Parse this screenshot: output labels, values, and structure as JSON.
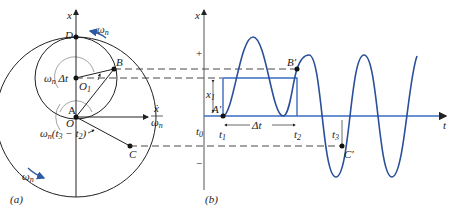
{
  "figure": {
    "panel_a": {
      "caption": "(a)",
      "axis_label": "x",
      "points": {
        "D": "D",
        "B": "B",
        "O1": "O",
        "O1_sub": "1",
        "A": "A",
        "O": "O",
        "C": "C"
      },
      "omega_top": "ω",
      "omega_top_sub": "n",
      "omega_bottom": "ω",
      "omega_bottom_sub": "n",
      "angle_dt": "ω",
      "angle_dt_sub": "n",
      "angle_dt_rest": " Δt",
      "angle_t3": "ω",
      "angle_t3_sub": "n",
      "angle_t3_rest": "(t",
      "angle_t3_sub3": "3",
      "angle_t3_mid": " − t",
      "angle_t3_sub2": "2",
      "angle_t3_end": ")",
      "horiz_axis_num": "ẋ",
      "horiz_axis_den": "ω",
      "horiz_axis_den_sub": "n",
      "colors": {
        "arrow": "#2b5aa0",
        "line": "#222222"
      }
    },
    "panel_b": {
      "caption": "(b)",
      "y_axis_label": "x",
      "x_axis_label": "t",
      "plus": "+",
      "minus": "−",
      "t0": "t",
      "t0_sub": "0",
      "t1": "t",
      "t1_sub": "1",
      "t2": "t",
      "t2_sub": "2",
      "t3": "t",
      "t3_sub": "3",
      "x1": "x",
      "x1_sub": "1",
      "delta_t": "Δt",
      "A_prime": "A′",
      "B_prime": "B′",
      "C_prime": "C′",
      "colors": {
        "curve": "#2b4f9a",
        "step": "#3a6cc0"
      }
    }
  }
}
